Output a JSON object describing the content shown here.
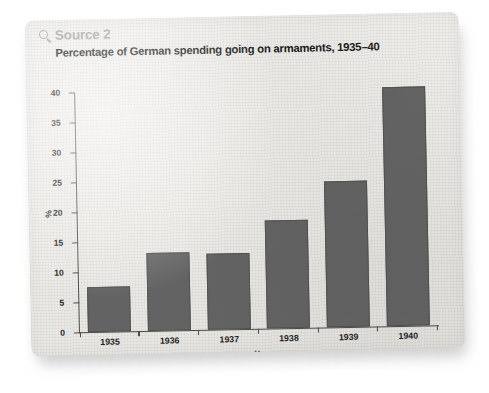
{
  "source": {
    "label": "Source 2",
    "icon": "magnifier-icon",
    "color": "#a6a5a1"
  },
  "chart_data": {
    "type": "bar",
    "title": "Percentage of German spending going on armaments, 1935–40",
    "categories": [
      "1935",
      "1936",
      "1937",
      "1938",
      "1939",
      "1940"
    ],
    "values": [
      7.5,
      13,
      12.8,
      18,
      24.5,
      40
    ],
    "xlabel": "Year",
    "ylabel": "%",
    "ylim": [
      0,
      40
    ],
    "yticks": [
      0,
      5,
      10,
      15,
      20,
      25,
      30,
      35,
      40
    ],
    "ytick_labels": [
      "0",
      "5",
      "10",
      "15",
      "20",
      "25",
      "30",
      "35",
      "40"
    ],
    "grid": false,
    "legend": false,
    "bar_color": "#636363",
    "axis_color": "#4a4a4a"
  }
}
